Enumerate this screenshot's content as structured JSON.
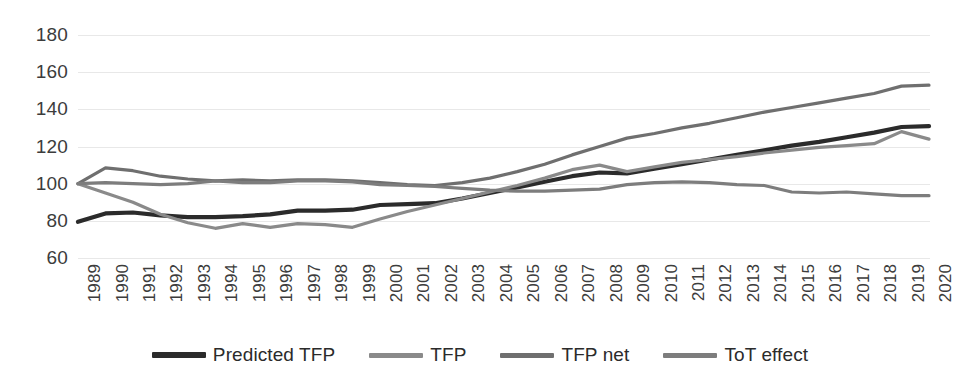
{
  "chart_data": {
    "type": "line",
    "title": "",
    "xlabel": "",
    "ylabel": "",
    "ylim": [
      60,
      180
    ],
    "yticks": [
      60,
      80,
      100,
      120,
      140,
      160,
      180
    ],
    "grid": true,
    "legend_position": "bottom",
    "categories": [
      "1989",
      "1990",
      "1991",
      "1992",
      "1993",
      "1994",
      "1995",
      "1996",
      "1997",
      "1998",
      "1999",
      "2000",
      "2001",
      "2002",
      "2003",
      "2004",
      "2005",
      "2006",
      "2007",
      "2008",
      "2009",
      "2010",
      "2011",
      "2012",
      "2013",
      "2014",
      "2015",
      "2016",
      "2017",
      "2018",
      "2019",
      "2020"
    ],
    "series": [
      {
        "name": "Predicted TFP",
        "color": "#2b2b2b",
        "values": [
          79.5,
          84.0,
          84.5,
          83.0,
          82.0,
          82.0,
          82.5,
          83.5,
          85.5,
          85.5,
          86.0,
          88.5,
          89.0,
          89.5,
          92.0,
          95.0,
          98.0,
          101.0,
          104.0,
          106.0,
          105.5,
          108.0,
          110.5,
          113.0,
          115.5,
          118.0,
          120.5,
          122.5,
          125.0,
          127.5,
          130.5,
          131.0
        ]
      },
      {
        "name": "TFP",
        "color": "#8a8a8a",
        "values": [
          100.0,
          95.0,
          90.0,
          83.5,
          79.0,
          76.0,
          78.5,
          76.5,
          78.5,
          78.0,
          76.5,
          81.0,
          85.0,
          88.5,
          92.0,
          95.5,
          99.0,
          103.0,
          107.5,
          110.0,
          106.5,
          109.0,
          111.5,
          113.0,
          114.5,
          116.5,
          118.0,
          119.5,
          120.5,
          121.5,
          128.0,
          124.0
        ]
      },
      {
        "name": "TFP net",
        "color": "#6f6f6f",
        "values": [
          100.0,
          108.5,
          107.0,
          104.0,
          102.5,
          101.5,
          102.0,
          101.5,
          102.0,
          102.0,
          101.5,
          100.5,
          99.5,
          99.0,
          100.5,
          103.0,
          106.5,
          110.5,
          115.5,
          120.0,
          124.5,
          127.0,
          130.0,
          132.5,
          135.5,
          138.5,
          141.0,
          143.5,
          146.0,
          148.5,
          152.5,
          153.0
        ]
      },
      {
        "name": "ToT effect",
        "color": "#7d7d7d",
        "values": [
          100.0,
          100.5,
          100.0,
          99.5,
          100.0,
          101.5,
          100.5,
          100.5,
          101.5,
          101.5,
          101.0,
          99.5,
          99.0,
          98.5,
          97.5,
          96.5,
          96.0,
          96.0,
          96.5,
          97.0,
          99.5,
          100.5,
          101.0,
          100.5,
          99.5,
          99.0,
          95.5,
          95.0,
          95.5,
          94.5,
          93.5,
          93.5
        ]
      }
    ]
  }
}
